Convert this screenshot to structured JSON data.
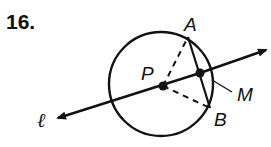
{
  "problem_number": "16.",
  "figure": {
    "labels": {
      "A": "A",
      "B": "B",
      "P": "P",
      "M": "M",
      "line": "ℓ"
    }
  }
}
